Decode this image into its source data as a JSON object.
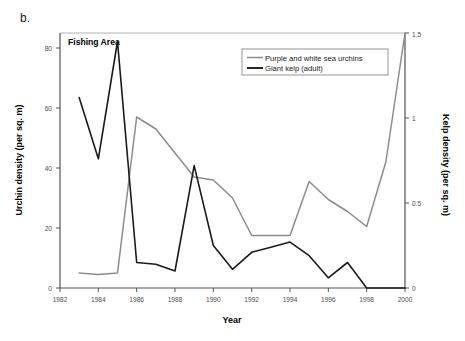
{
  "panel": {
    "label": "b."
  },
  "chart_data": {
    "type": "line",
    "title": "Fishing Area",
    "xlabel": "Year",
    "ylabel": "Urchin density (per sq. m)",
    "y2label": "Kelp density (per sq. m)",
    "xlim": [
      1982,
      2000
    ],
    "ylim": [
      0,
      85
    ],
    "y2lim": [
      0,
      1.5
    ],
    "xticks": [
      1982,
      1984,
      1986,
      1988,
      1990,
      1992,
      1994,
      1996,
      1998,
      2000
    ],
    "xticklabels": [
      "1982",
      "1984",
      "1986",
      "1988",
      "1990",
      "1992",
      "1994",
      "1996",
      "1998",
      "2000"
    ],
    "yticks": [
      0,
      20,
      40,
      60,
      80
    ],
    "yticklabels": [
      "0",
      "20",
      "40",
      "60",
      "80"
    ],
    "y2ticks": [
      0,
      0.5,
      1,
      1.5
    ],
    "y2ticklabels": [
      "0",
      "0.5",
      "1",
      "1.5"
    ],
    "grid": false,
    "legend_position": "top-right",
    "series": [
      {
        "name": "Purple and white sea urchins",
        "color": "#8c8c8c",
        "axis": "left",
        "unit": "per sq. m",
        "x": [
          1983,
          1984,
          1985,
          1986,
          1987,
          1988,
          1989,
          1990,
          1991,
          1992,
          1993,
          1994,
          1995,
          1996,
          1997,
          1998,
          1999,
          2000
        ],
        "values": [
          5,
          4.5,
          5,
          57,
          53,
          45,
          37,
          36,
          30,
          17.5,
          17.5,
          17.5,
          35.5,
          29.5,
          25.5,
          20.5,
          42,
          85
        ]
      },
      {
        "name": "Giant kelp (adult)",
        "color": "#1a1a1a",
        "axis": "right",
        "unit": "per sq. m",
        "x": [
          1983,
          1984,
          1985,
          1986,
          1987,
          1988,
          1989,
          1990,
          1991,
          1992,
          1993,
          1994,
          1995,
          1996,
          1997,
          1998,
          1999,
          2000
        ],
        "values": [
          1.12,
          0.76,
          1.45,
          0.15,
          0.14,
          0.1,
          0.72,
          0.25,
          0.11,
          0.21,
          0.24,
          0.27,
          0.19,
          0.06,
          0.15,
          0.0,
          0.0,
          0.0
        ]
      }
    ],
    "legend": [
      {
        "label": "Purple and white sea urchins",
        "color": "#8c8c8c"
      },
      {
        "label": "Giant kelp (adult)",
        "color": "#1a1a1a"
      }
    ]
  }
}
